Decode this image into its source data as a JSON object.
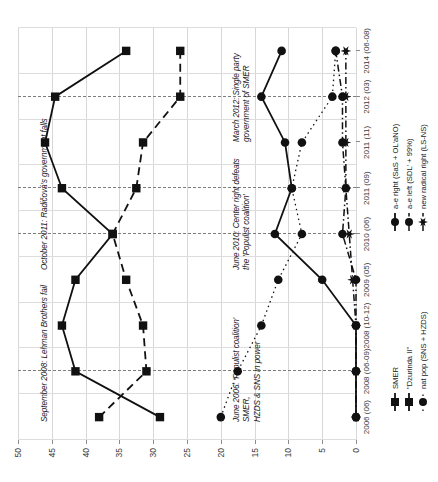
{
  "chart_data": {
    "type": "line",
    "title": "",
    "subtitle": "",
    "xlabel": "",
    "ylabel": "",
    "ylim": [
      0,
      50
    ],
    "yticks": [
      0,
      5,
      10,
      15,
      20,
      25,
      30,
      35,
      40,
      45,
      50
    ],
    "grid": true,
    "legend_position": "bottom",
    "categories": [
      "2006 (06)",
      "2008 (06-09)",
      "2008 (10-12)",
      "2009 (05)",
      "2010 (06)",
      "2011 (09)",
      "2011 (11)",
      "2012 (03)",
      "2014 (06-08)"
    ],
    "series": [
      {
        "name": "SMER",
        "marker": "filled-square",
        "line": "solid",
        "values": [
          29,
          41.5,
          43.5,
          41.5,
          36,
          43.5,
          46,
          44.5,
          34
        ]
      },
      {
        "name": "\"Dzurinda II\"",
        "marker": "filled-square",
        "line": "dashed",
        "values": [
          38,
          31,
          31.5,
          34,
          36,
          32.5,
          31.5,
          26,
          26
        ]
      },
      {
        "name": "nat pop (SNS + HZDS)",
        "marker": "filled-circle",
        "line": "dotted",
        "values": [
          20,
          17.5,
          14,
          11.5,
          8,
          9.5,
          8,
          3.5,
          3
        ]
      },
      {
        "name": "a-e right (SaS + OL'aNO)",
        "marker": "filled-circle",
        "line": "solid",
        "values": [
          0,
          0,
          0,
          5,
          12,
          9.5,
          10.5,
          14,
          11
        ]
      },
      {
        "name": "a-e left (SDL' + 99%)",
        "marker": "filled-circle",
        "line": "dash-dot",
        "values": [
          0,
          0,
          0,
          0,
          2,
          1.5,
          2,
          2,
          3
        ]
      },
      {
        "name": "new radical right (LS-NS)",
        "marker": "star",
        "line": "dash-dot",
        "values": [
          0,
          0,
          0,
          0.5,
          1,
          1.5,
          1.5,
          1.5,
          1.5
        ]
      }
    ],
    "annotations": [
      {
        "id": "annot-2006",
        "text": "June 2006: 'Populist coalition' SMER,\nHZDS & SNS in power",
        "at_category": "2008 (06-09)"
      },
      {
        "id": "annot-2008",
        "text": "September 2008: Lehman Brothers fail",
        "at_category": "2008 (06-09)"
      },
      {
        "id": "annot-2010",
        "text": "June 2010: Center right defeats\nthe 'Populist coalition'",
        "at_category": "2010 (06)"
      },
      {
        "id": "annot-2011",
        "text": "October 2011: Radičová's government falls",
        "at_category": "2011 (09)"
      },
      {
        "id": "annot-2012",
        "text": "March 2012: Single party\ngovernment of SMER",
        "at_category": "2012 (03)"
      }
    ],
    "event_lines": [
      "2008 (06-09)",
      "2010 (06)",
      "2011 (09)",
      "2012 (03)"
    ],
    "colors": {
      "ink": "#111111",
      "grid": "#d7d7d7",
      "axis": "#8a8a8a"
    }
  },
  "legend": {
    "columns": [
      {
        "items": [
          {
            "label": "SMER",
            "marker": "filled-square",
            "line": "solid"
          },
          {
            "label": "\"Dzurinda II\"",
            "marker": "filled-square",
            "line": "dashed"
          },
          {
            "label": "nat pop (SNS + HZDS)",
            "marker": "filled-circle",
            "line": "dotted"
          }
        ]
      },
      {
        "items": [
          {
            "label": "a-e right (SaS + OL'aNO)",
            "marker": "filled-circle",
            "line": "solid"
          },
          {
            "label": "a-e left (SDL' + 99%)",
            "marker": "filled-circle",
            "line": "dash-dot"
          },
          {
            "label": "new radical right (LS-NS)",
            "marker": "star",
            "line": "dash-dot"
          }
        ]
      }
    ]
  }
}
